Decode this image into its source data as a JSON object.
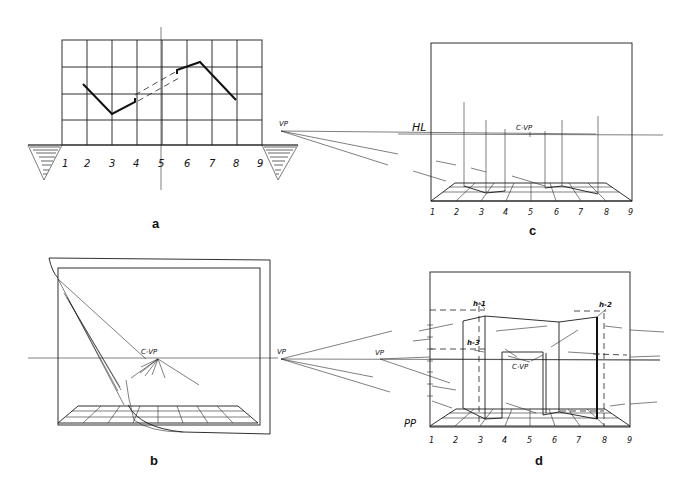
{
  "figure": {
    "panels": [
      {
        "id": "a",
        "label": "a",
        "description": "Plan view grid with zig-zag wall line"
      },
      {
        "id": "b",
        "label": "b",
        "description": "Picture plane with center vanishing point and viewing cone"
      },
      {
        "id": "c",
        "label": "c",
        "description": "Perspective floor grid with vertical height lines"
      },
      {
        "id": "d",
        "label": "d",
        "description": "Completed perspective of walls with doorway"
      }
    ],
    "grid_numbers": [
      "1",
      "2",
      "3",
      "4",
      "5",
      "6",
      "7",
      "8",
      "9"
    ],
    "labels": {
      "vp": "VP",
      "hl": "HL",
      "cvp": "C-VP",
      "pp": "PP",
      "h1": "h-1",
      "h2": "h-2",
      "h3": "h-3"
    }
  }
}
